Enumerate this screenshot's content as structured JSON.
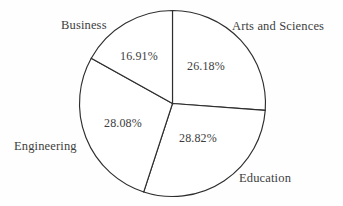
{
  "chart_data": {
    "type": "pie",
    "title": "",
    "labels": [
      "Arts and Sciences",
      "Education",
      "Engineering",
      "Business"
    ],
    "values": [
      26.18,
      28.82,
      28.08,
      16.91
    ],
    "value_labels": [
      "26.18%",
      "28.82%",
      "28.08%",
      "16.91%"
    ],
    "units": "percent",
    "start_angle_deg": 0,
    "direction": "clockwise",
    "legend": "none",
    "label_placement": "outside-category-inside-value",
    "grid": false,
    "colors": {
      "slice_fill": "#ffffff",
      "slice_stroke": "#2e2e2e",
      "text": "#3d3d3d",
      "background": "#fefefe"
    },
    "geometry": {
      "center_x": 172.5,
      "center_y": 103.5,
      "radius": 93
    }
  },
  "slices": [
    {
      "name": "Arts and Sciences",
      "percent_text": "26.18%",
      "category_label": "Arts and Sciences"
    },
    {
      "name": "Education",
      "percent_text": "28.82%",
      "category_label": "Education"
    },
    {
      "name": "Engineering",
      "percent_text": "28.08%",
      "category_label": "Engineering"
    },
    {
      "name": "Business",
      "percent_text": "16.91%",
      "category_label": "Business"
    }
  ]
}
